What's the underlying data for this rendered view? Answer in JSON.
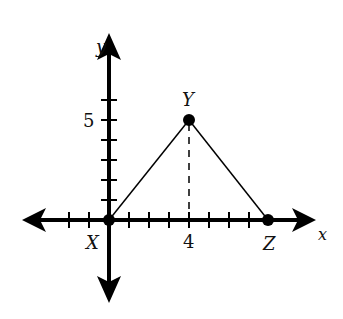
{
  "figure": {
    "type": "coordinate-plane triangle",
    "axes": {
      "x_label": "x",
      "y_label": "y",
      "x_tick_label": "4",
      "y_tick_label": "5",
      "x_ticks": [
        -2,
        -1,
        1,
        2,
        3,
        4,
        5,
        6,
        7
      ],
      "y_ticks": [
        1,
        2,
        3,
        4,
        5,
        6
      ]
    },
    "points": [
      {
        "name": "X",
        "x": 0,
        "y": 0
      },
      {
        "name": "Y",
        "x": 4,
        "y": 5
      },
      {
        "name": "Z",
        "x": 8,
        "y": 0
      }
    ],
    "segments": [
      [
        "X",
        "Y"
      ],
      [
        "Y",
        "Z"
      ]
    ],
    "dashed_altitude": {
      "from": "Y",
      "to_x": 4
    }
  }
}
